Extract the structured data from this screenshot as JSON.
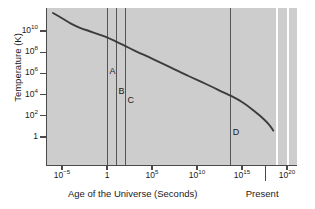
{
  "chart_data": {
    "type": "line",
    "title": "",
    "xlabel": "Age of the Universe (Seconds)",
    "ylabel": "Temperature (K)",
    "xscale": "log",
    "yscale": "log",
    "xlim": [
      1e-07,
      1e+20
    ],
    "ylim": [
      0.1,
      1000000000000.0
    ],
    "grid": false,
    "legend": "none",
    "xticks": [
      {
        "label": "10",
        "exp": "−5",
        "value": 1e-05
      },
      {
        "label": "1",
        "exp": "",
        "value": 1
      },
      {
        "label": "10",
        "exp": "5",
        "value": 100000.0
      },
      {
        "label": "10",
        "exp": "10",
        "value": 10000000000.0
      },
      {
        "label": "10",
        "exp": "15",
        "value": 1000000000000000.0
      },
      {
        "label": "10",
        "exp": "20",
        "value": 1e+20
      }
    ],
    "yticks": [
      {
        "label": "10",
        "exp": "10",
        "value": 10000000000.0
      },
      {
        "label": "10",
        "exp": "8",
        "value": 100000000.0
      },
      {
        "label": "10",
        "exp": "6",
        "value": 1000000.0
      },
      {
        "label": "10",
        "exp": "4",
        "value": 10000.0
      },
      {
        "label": "10",
        "exp": "2",
        "value": 100.0
      },
      {
        "label": "1",
        "exp": "",
        "value": 1
      }
    ],
    "series": [
      {
        "name": "Temperature of the Universe",
        "points": [
          {
            "x": 1e-06,
            "y": 500000000000.0
          },
          {
            "x": 1e-05,
            "y": 160000000000.0
          },
          {
            "x": 0.0001,
            "y": 50000000000.0
          },
          {
            "x": 0.001,
            "y": 20000000000.0
          },
          {
            "x": 0.01,
            "y": 10000000000.0
          },
          {
            "x": 0.1,
            "y": 5000000000.0
          },
          {
            "x": 1.0,
            "y": 2500000000.0
          },
          {
            "x": 10.0,
            "y": 1000000000.0
          },
          {
            "x": 100.0,
            "y": 400000000.0
          },
          {
            "x": 1000.0,
            "y": 150000000.0
          },
          {
            "x": 100000.0,
            "y": 25000000.0
          },
          {
            "x": 10000000.0,
            "y": 4000000.0
          },
          {
            "x": 1000000000.0,
            "y": 600000.0
          },
          {
            "x": 100000000000.0,
            "y": 100000.0
          },
          {
            "x": 10000000000000.0,
            "y": 15000.0
          },
          {
            "x": 100000000000000.0,
            "y": 6000.0
          },
          {
            "x": 1000000000000000.0,
            "y": 2000.0
          },
          {
            "x": 1e+16,
            "y": 500.0
          },
          {
            "x": 1e+17,
            "y": 100.0
          },
          {
            "x": 1e+18,
            "y": 15.0
          },
          {
            "x": 3e+18,
            "y": 4.0
          }
        ]
      }
    ],
    "markers": [
      {
        "id": "A",
        "label": "A",
        "x": 1.0,
        "label_y": 1200000.0
      },
      {
        "id": "B",
        "label": "B",
        "x": 10.0,
        "label_y": 15000.0
      },
      {
        "id": "C",
        "label": "C",
        "x": 100.0,
        "label_y": 2000.0
      },
      {
        "id": "D",
        "label": "D",
        "x": 50000000000000.0,
        "label_y": 2.0
      }
    ],
    "annotations": [
      {
        "id": "present",
        "label": "Present",
        "x": 4.4e+17
      }
    ],
    "colors": {
      "panel_background": "#cdcdcd",
      "axis": "#4a4a4a",
      "curve": "#3c3c3c",
      "marker_line": "#555555",
      "text": "#1a1a1a",
      "figure_background": "#ffffff"
    }
  }
}
